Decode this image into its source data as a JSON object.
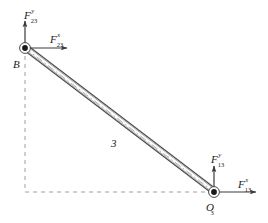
{
  "figure": {
    "type": "free-body-diagram",
    "background_color": "#ffffff",
    "line_color": "#404040",
    "dash_color": "#9a9a9a",
    "text_color": "#1a1a1a"
  },
  "joints": {
    "upper": {
      "name": "B",
      "label": "B",
      "x": 25,
      "y": 48,
      "marker": "pin-joint-icon"
    },
    "lower": {
      "name": "O3",
      "label_base": "O",
      "label_sub": "3",
      "x": 214,
      "y": 192,
      "marker": "pin-joint-icon"
    }
  },
  "link": {
    "number_label": "3",
    "number_label_x": 113,
    "number_label_y": 140,
    "centerline_style": "dash-dot"
  },
  "forces": [
    {
      "id": "F23y",
      "base": "F",
      "superscript": "y",
      "subscript": "23",
      "at_joint": "B",
      "direction": "up",
      "label_x": 24,
      "label_y": 6
    },
    {
      "id": "F23x",
      "base": "F",
      "superscript": "x",
      "subscript": "23",
      "at_joint": "B",
      "direction": "right",
      "label_x": 50,
      "label_y": 30
    },
    {
      "id": "F13y",
      "base": "F",
      "superscript": "y",
      "subscript": "13",
      "at_joint": "O3",
      "direction": "up",
      "label_x": 212,
      "label_y": 150
    },
    {
      "id": "F13x",
      "base": "F",
      "superscript": "x",
      "subscript": "13",
      "at_joint": "O3",
      "direction": "right",
      "label_x": 239,
      "label_y": 175
    }
  ],
  "construction_lines": {
    "vertical_from_B": {
      "x": 25,
      "y1": 56,
      "y2": 192
    },
    "horizontal_to_O3": {
      "y": 192,
      "x1": 25,
      "x2": 206
    },
    "style": "dashed"
  }
}
